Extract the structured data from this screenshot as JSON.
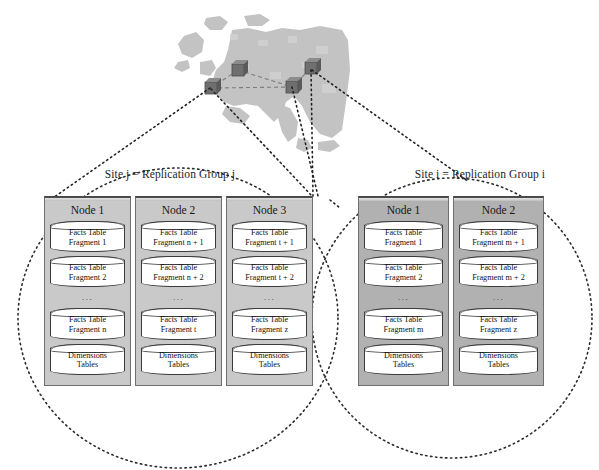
{
  "diagram": {
    "background_color": "#ffffff",
    "map": {
      "name": "europe-map",
      "land_color": "#c2c2c2",
      "sea_color": "#ffffff",
      "marker_color": "#6e6e6e",
      "markers": [
        {
          "id": "marker-1",
          "x": 41,
          "y": 78
        },
        {
          "id": "marker-2",
          "x": 68,
          "y": 60
        },
        {
          "id": "marker-3",
          "x": 122,
          "y": 77
        },
        {
          "id": "marker-4",
          "x": 141,
          "y": 58
        }
      ],
      "links": [
        {
          "from": "marker-1",
          "to": "marker-2"
        },
        {
          "from": "marker-2",
          "to": "marker-3"
        },
        {
          "from": "marker-1",
          "to": "marker-3"
        },
        {
          "from": "marker-3",
          "to": "marker-4"
        }
      ]
    },
    "sites": [
      {
        "id": "site-j",
        "title": "Site j = Replication Group j",
        "panel_shade": "light",
        "nodes": [
          {
            "title": "Node 1",
            "stores": [
              {
                "line1": "Facts Table",
                "line2": "Fragment 1"
              },
              {
                "line1": "Facts Table",
                "line2": "Fragment 2"
              }
            ],
            "ellipsis": "...",
            "stores_after": [
              {
                "line1": "Facts Table",
                "line2": "Fragment n"
              },
              {
                "line1": "Dimensions",
                "line2": "Tables"
              }
            ]
          },
          {
            "title": "Node 2",
            "stores": [
              {
                "line1": "Facts Table",
                "line2": "Fragment n + 1"
              },
              {
                "line1": "Facts Table",
                "line2": "Fragment n + 2"
              }
            ],
            "ellipsis": "...",
            "stores_after": [
              {
                "line1": "Facts Table",
                "line2": "Fragment t"
              },
              {
                "line1": "Dimensions",
                "line2": "Tables"
              }
            ]
          },
          {
            "title": "Node 3",
            "stores": [
              {
                "line1": "Facts Table",
                "line2": "Fragment t + 1"
              },
              {
                "line1": "Facts Table",
                "line2": "Fragment t + 2"
              }
            ],
            "ellipsis": "...",
            "stores_after": [
              {
                "line1": "Facts Table",
                "line2": "Fragment z"
              },
              {
                "line1": "Dimensions",
                "line2": "Tables"
              }
            ]
          }
        ]
      },
      {
        "id": "site-i",
        "title": "Site i = Replication Group i",
        "panel_shade": "dark",
        "nodes": [
          {
            "title": "Node 1",
            "stores": [
              {
                "line1": "Facts Table",
                "line2": "Fragment 1"
              },
              {
                "line1": "Facts Table",
                "line2": "Fragment 2"
              }
            ],
            "ellipsis": "...",
            "stores_after": [
              {
                "line1": "Facts Table",
                "line2": "Fragment m"
              },
              {
                "line1": "Dimensions",
                "line2": "Tables"
              }
            ]
          },
          {
            "title": "Node 2",
            "stores": [
              {
                "line1": "Facts Table",
                "line2": "Fragment m + 1"
              },
              {
                "line1": "Facts Table",
                "line2": "Fragment m + 2"
              }
            ],
            "ellipsis": "...",
            "stores_after": [
              {
                "line1": "Facts Table",
                "line2": "Fragment z"
              },
              {
                "line1": "Dimensions",
                "line2": "Tables"
              }
            ]
          }
        ]
      }
    ],
    "group_boundaries": [
      {
        "id": "ellipse-site-j",
        "cx": 178,
        "cy": 318,
        "rx": 160,
        "ry": 150,
        "style": "dotted"
      },
      {
        "id": "ellipse-site-i",
        "cx": 452,
        "cy": 318,
        "rx": 140,
        "ry": 140,
        "style": "dotted"
      }
    ],
    "callouts": [
      {
        "id": "callout-j-left",
        "from_x": 211,
        "from_y": 88,
        "to_x": 52,
        "to_y": 200
      },
      {
        "id": "callout-j-right",
        "from_x": 211,
        "from_y": 88,
        "to_x": 313,
        "to_y": 196
      },
      {
        "id": "callout-j-mid",
        "from_x": 292,
        "from_y": 86,
        "to_x": 316,
        "to_y": 195
      },
      {
        "id": "callout-j-vert",
        "from_x": 311,
        "from_y": 70,
        "to_x": 311,
        "to_y": 196
      },
      {
        "id": "callout-i-right",
        "from_x": 311,
        "from_y": 70,
        "to_x": 466,
        "to_y": 180
      },
      {
        "id": "callout-i-left",
        "from_x": 311,
        "from_y": 70,
        "to_x": 330,
        "to_y": 200
      }
    ]
  }
}
